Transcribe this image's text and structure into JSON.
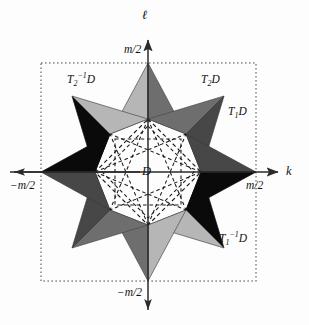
{
  "figure": {
    "title": "",
    "axes": {
      "horizontal_label": "k",
      "vertical_label": "ℓ",
      "tick_right": "m/2",
      "tick_left": "−m/2",
      "tick_top": "m/2",
      "tick_bottom": "−m/2"
    },
    "center_region_label": "D",
    "region_labels": [
      {
        "name": "top-left-region",
        "text": "T₂⁻¹D",
        "base": "T",
        "sub": "2",
        "sup": "−1",
        "tail": "D"
      },
      {
        "name": "top-right-region",
        "text": "T₂D",
        "base": "T",
        "sub": "2",
        "sup": "",
        "tail": "D"
      },
      {
        "name": "right-upper-region",
        "text": "T₁D",
        "base": "T",
        "sub": "1",
        "sup": "",
        "tail": "D"
      },
      {
        "name": "right-lower-region",
        "text": "T₁⁻¹D",
        "base": "T",
        "sub": "1",
        "sup": "−1",
        "tail": "D"
      }
    ],
    "colors": {
      "background": "#fdfdfd",
      "black_wedge": "#0a0a0a",
      "dark_gray_wedge": "#474747",
      "mid_gray_wedge": "#6e6e6e",
      "light_gray_wedge": "#b6b6b6",
      "axis_line": "#2a2a2a",
      "dotted_boundary": "#555555",
      "dashed_inner": "#1a1a1a",
      "text": "#111111"
    },
    "geometry": {
      "center": [
        148,
        172
      ],
      "boundary_square": {
        "x1": 41,
        "y1": 63,
        "x2": 256,
        "y2": 281
      },
      "inner_diamond_radius": 53,
      "star_point_radius": 107,
      "note": "eight-pointed star of triangular wedges; dashed rotated-square and dashed eight-point star inside"
    }
  }
}
